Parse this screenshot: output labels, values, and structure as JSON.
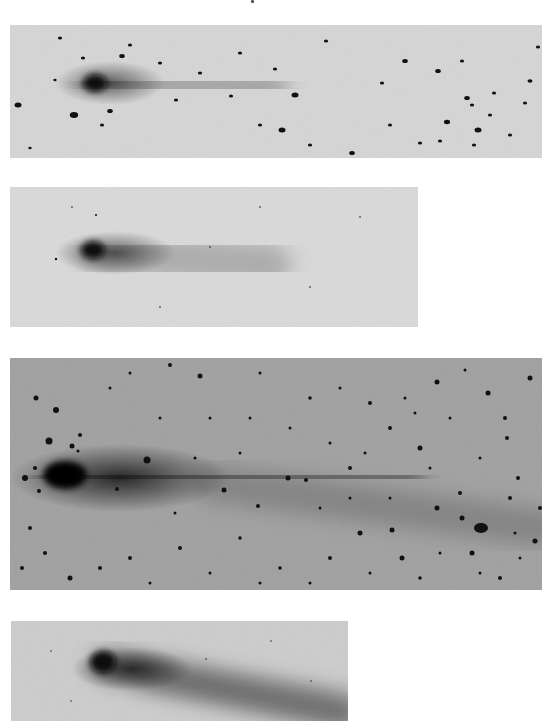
{
  "page": {
    "background": "#ffffff"
  },
  "panels": [
    {
      "id": "plate-1",
      "x": 10,
      "y": 25,
      "w": 532,
      "h": 133,
      "bg": "#d9d9d9",
      "head": {
        "cx": 85,
        "cy": 58,
        "rx": 12,
        "ry": 9,
        "color": "#0a0a0a"
      },
      "coma": {
        "cx": 100,
        "cy": 58,
        "rx": 55,
        "ry": 22,
        "opacity": 0.55
      },
      "tails": [
        {
          "x1": 85,
          "y1": 58,
          "x2": 260,
          "y2": 62,
          "width": 38,
          "opacity": 0.22
        }
      ],
      "stars": [
        [
          112,
          31,
          2
        ],
        [
          100,
          86,
          2
        ],
        [
          73,
          33,
          1.5
        ],
        [
          8,
          80,
          2.5
        ],
        [
          64,
          90,
          3
        ],
        [
          50,
          13,
          1.5
        ],
        [
          92,
          100,
          1.5
        ],
        [
          120,
          20,
          1.5
        ],
        [
          150,
          38,
          1.5
        ],
        [
          166,
          75,
          1.5
        ],
        [
          221,
          71,
          1.5
        ],
        [
          230,
          28,
          1.5
        ],
        [
          265,
          44,
          1.5
        ],
        [
          285,
          70,
          2.5
        ],
        [
          272,
          105,
          2.5
        ],
        [
          316,
          16,
          1.5
        ],
        [
          342,
          128,
          2
        ],
        [
          372,
          58,
          1.5
        ],
        [
          395,
          36,
          2
        ],
        [
          428,
          46,
          2
        ],
        [
          437,
          97,
          2.2
        ],
        [
          430,
          116,
          1.5
        ],
        [
          452,
          36,
          1.5
        ],
        [
          457,
          73,
          2
        ],
        [
          464,
          120,
          1.5
        ],
        [
          462,
          80,
          1.5
        ],
        [
          468,
          105,
          2.5
        ],
        [
          484,
          68,
          1.5
        ],
        [
          520,
          56,
          1.8
        ],
        [
          528,
          22,
          1.5
        ],
        [
          515,
          78,
          1.5
        ],
        [
          250,
          100,
          1.5
        ],
        [
          190,
          48,
          1.5
        ],
        [
          300,
          120,
          1.5
        ],
        [
          380,
          100,
          1.5
        ],
        [
          410,
          118,
          1.5
        ],
        [
          480,
          90,
          1.5
        ],
        [
          500,
          110,
          1.5
        ],
        [
          20,
          123,
          1.2
        ],
        [
          45,
          55,
          1.2
        ]
      ]
    },
    {
      "id": "plate-2",
      "x": 10,
      "y": 187,
      "w": 408,
      "h": 140,
      "bg": "#dedede",
      "head": {
        "cx": 83,
        "cy": 63,
        "rx": 12,
        "ry": 9,
        "color": "#0a0a0a"
      },
      "coma": {
        "cx": 105,
        "cy": 66,
        "rx": 60,
        "ry": 22,
        "opacity": 0.55
      },
      "tails": [
        {
          "x1": 90,
          "y1": 65,
          "x2": 260,
          "y2": 78,
          "width": 44,
          "opacity": 0.2
        }
      ],
      "stars": [
        [
          46,
          72,
          1.2
        ],
        [
          86,
          28,
          1
        ],
        [
          62,
          20,
          0.8
        ],
        [
          200,
          60,
          0.8
        ],
        [
          300,
          100,
          0.8
        ],
        [
          350,
          30,
          0.8
        ],
        [
          150,
          120,
          0.8
        ],
        [
          250,
          20,
          0.8
        ]
      ]
    },
    {
      "id": "plate-3",
      "x": 10,
      "y": 358,
      "w": 532,
      "h": 232,
      "bg": "#9c9c9c",
      "head": {
        "cx": 55,
        "cy": 117,
        "rx": 22,
        "ry": 14,
        "color": "#050505"
      },
      "coma": {
        "cx": 110,
        "cy": 120,
        "rx": 110,
        "ry": 34,
        "opacity": 0.75
      },
      "tails": [
        {
          "x1": 60,
          "y1": 118,
          "x2": 380,
          "y2": 120,
          "width": 70,
          "opacity": 0.32
        },
        {
          "x1": 200,
          "y1": 125,
          "x2": 532,
          "y2": 170,
          "width": 36,
          "opacity": 0.18
        }
      ],
      "blob": {
        "cx": 471,
        "cy": 170,
        "rx": 7,
        "ry": 5
      },
      "stars": [
        [
          26,
          40,
          2.5
        ],
        [
          46,
          52,
          3
        ],
        [
          39,
          83,
          3.5
        ],
        [
          62,
          88,
          2.5
        ],
        [
          68,
          93,
          1.5
        ],
        [
          70,
          77,
          2
        ],
        [
          15,
          120,
          3
        ],
        [
          25,
          110,
          2
        ],
        [
          29,
          133,
          2
        ],
        [
          107,
          131,
          2
        ],
        [
          137,
          102,
          3.5
        ],
        [
          160,
          7,
          2
        ],
        [
          190,
          18,
          2.5
        ],
        [
          214,
          132,
          2.5
        ],
        [
          248,
          148,
          2
        ],
        [
          278,
          120,
          2.5
        ],
        [
          296,
          122,
          2
        ],
        [
          340,
          110,
          2
        ],
        [
          380,
          70,
          2
        ],
        [
          350,
          175,
          2.5
        ],
        [
          382,
          172,
          2.5
        ],
        [
          392,
          200,
          2.5
        ],
        [
          427,
          24,
          2.5
        ],
        [
          410,
          90,
          2.5
        ],
        [
          427,
          150,
          2.5
        ],
        [
          452,
          160,
          2.5
        ],
        [
          462,
          195,
          2.5
        ],
        [
          478,
          35,
          2.5
        ],
        [
          495,
          60,
          2
        ],
        [
          497,
          80,
          2
        ],
        [
          508,
          120,
          2
        ],
        [
          520,
          20,
          2.5
        ],
        [
          525,
          183,
          2.5
        ],
        [
          530,
          150,
          2
        ],
        [
          450,
          135,
          2
        ],
        [
          320,
          200,
          2
        ],
        [
          270,
          210,
          1.8
        ],
        [
          230,
          180,
          1.8
        ],
        [
          170,
          190,
          2
        ],
        [
          120,
          200,
          2
        ],
        [
          90,
          210,
          2
        ],
        [
          60,
          220,
          2.5
        ],
        [
          35,
          195,
          2
        ],
        [
          20,
          170,
          2
        ],
        [
          12,
          210,
          2
        ],
        [
          150,
          60,
          1.5
        ],
        [
          200,
          60,
          1.5
        ],
        [
          240,
          60,
          1.5
        ],
        [
          300,
          40,
          1.8
        ],
        [
          330,
          30,
          1.5
        ],
        [
          360,
          45,
          2
        ],
        [
          405,
          55,
          1.5
        ],
        [
          440,
          60,
          1.5
        ],
        [
          470,
          100,
          1.5
        ],
        [
          500,
          140,
          2
        ],
        [
          510,
          200,
          1.5
        ],
        [
          490,
          220,
          2
        ],
        [
          410,
          220,
          1.8
        ],
        [
          360,
          215,
          1.5
        ],
        [
          300,
          225,
          1.5
        ],
        [
          250,
          225,
          1.5
        ],
        [
          200,
          215,
          1.5
        ],
        [
          140,
          225,
          1.5
        ],
        [
          380,
          140,
          1.5
        ],
        [
          420,
          110,
          1.5
        ],
        [
          455,
          12,
          1.5
        ],
        [
          100,
          30,
          1.5
        ],
        [
          120,
          15,
          1.5
        ],
        [
          250,
          15,
          1.5
        ],
        [
          280,
          70,
          1.5
        ],
        [
          320,
          85,
          1.5
        ],
        [
          355,
          95,
          1.5
        ],
        [
          395,
          40,
          1.5
        ],
        [
          185,
          100,
          1.5
        ],
        [
          230,
          95,
          1.5
        ],
        [
          165,
          155,
          1.5
        ],
        [
          310,
          150,
          1.5
        ],
        [
          340,
          140,
          1.5
        ],
        [
          430,
          195,
          1.5
        ],
        [
          470,
          215,
          1.5
        ],
        [
          505,
          175,
          1.5
        ]
      ]
    },
    {
      "id": "plate-4",
      "x": 11,
      "y": 621,
      "w": 337,
      "h": 100,
      "bg": "#cfcfcf",
      "head": {
        "cx": 92,
        "cy": 41,
        "rx": 13,
        "ry": 11,
        "color": "#080808"
      },
      "coma": {
        "cx": 120,
        "cy": 48,
        "rx": 60,
        "ry": 22,
        "opacity": 0.65
      },
      "tails": [
        {
          "x1": 95,
          "y1": 44,
          "x2": 337,
          "y2": 92,
          "width": 30,
          "opacity": 0.38
        },
        {
          "x1": 130,
          "y1": 60,
          "x2": 337,
          "y2": 100,
          "width": 12,
          "opacity": 0.25
        },
        {
          "x1": 110,
          "y1": 40,
          "x2": 337,
          "y2": 78,
          "width": 14,
          "opacity": 0.2
        }
      ],
      "stars": [
        [
          195,
          38,
          0.8
        ],
        [
          40,
          30,
          0.7
        ],
        [
          260,
          20,
          0.7
        ],
        [
          300,
          60,
          0.7
        ],
        [
          60,
          80,
          0.7
        ]
      ]
    }
  ]
}
